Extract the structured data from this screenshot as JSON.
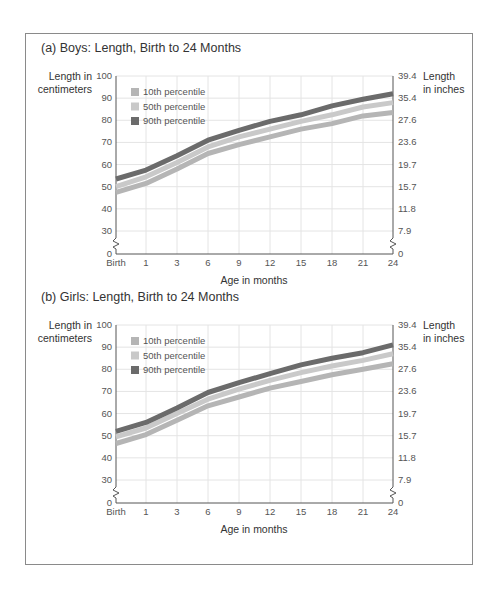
{
  "chart_data": [
    {
      "type": "line",
      "title": "(a) Boys: Length, Birth to 24 Months",
      "xlabel": "Age in months",
      "ylabel": "Length in centimeters",
      "ylabel_right": "Length in inches",
      "x": [
        "Birth",
        "1",
        "3",
        "6",
        "9",
        "12",
        "15",
        "18",
        "21",
        "24"
      ],
      "y_ticks_left": [
        "100",
        "90",
        "80",
        "70",
        "60",
        "50",
        "40",
        "30",
        "0"
      ],
      "y_ticks_right": [
        "39.4",
        "35.4",
        "27.6",
        "23.6",
        "19.7",
        "15.7",
        "11.8",
        "7.9",
        "0"
      ],
      "ylim": [
        0,
        100
      ],
      "axis_break": true,
      "grid": true,
      "legend_position": "upper-left",
      "series": [
        {
          "name": "10th percentile",
          "color": "#b5b5b5",
          "values": [
            47.5,
            51.5,
            58,
            65,
            69,
            72.5,
            76,
            78.5,
            82,
            83.5
          ]
        },
        {
          "name": "50th percentile",
          "color": "#c9c9c9",
          "values": [
            50,
            54.5,
            61,
            68,
            72.5,
            76,
            79.5,
            82.5,
            86,
            88
          ]
        },
        {
          "name": "90th percentile",
          "color": "#6b6b6b",
          "values": [
            53.5,
            57.5,
            64,
            71,
            75.5,
            79.5,
            82.5,
            86.5,
            89.5,
            92
          ]
        }
      ]
    },
    {
      "type": "line",
      "title": "(b) Girls: Length, Birth to 24 Months",
      "xlabel": "Age in months",
      "ylabel": "Length in centimeters",
      "ylabel_right": "Length in inches",
      "x": [
        "Birth",
        "1",
        "3",
        "6",
        "9",
        "12",
        "15",
        "18",
        "21",
        "24"
      ],
      "y_ticks_left": [
        "100",
        "90",
        "80",
        "70",
        "60",
        "50",
        "40",
        "30",
        "0"
      ],
      "y_ticks_right": [
        "39.4",
        "35.4",
        "27.6",
        "23.6",
        "19.7",
        "15.7",
        "11.8",
        "7.9",
        "0"
      ],
      "ylim": [
        0,
        100
      ],
      "axis_break": true,
      "grid": true,
      "legend_position": "upper-left",
      "series": [
        {
          "name": "10th percentile",
          "color": "#b5b5b5",
          "values": [
            46.5,
            50.5,
            57,
            63.5,
            67.5,
            71.5,
            74.5,
            77.5,
            80,
            82.5
          ]
        },
        {
          "name": "50th percentile",
          "color": "#c9c9c9",
          "values": [
            49.5,
            53.5,
            60,
            66.5,
            71,
            75,
            78.5,
            81.5,
            84,
            87
          ]
        },
        {
          "name": "90th percentile",
          "color": "#6b6b6b",
          "values": [
            52,
            56,
            62.5,
            69.5,
            74,
            78,
            82,
            85,
            87.5,
            91
          ]
        }
      ]
    }
  ],
  "labels": {
    "ylabel_left_line1": "Length in",
    "ylabel_left_line2": "centimeters",
    "ylabel_right_line1": "Length",
    "ylabel_right_line2": "in inches"
  }
}
